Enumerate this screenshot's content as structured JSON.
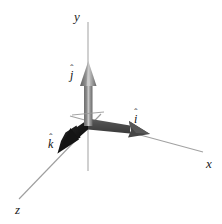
{
  "figure": {
    "background_color": "#ffffff",
    "width": 222,
    "height": 224
  },
  "axes": [
    {
      "name": "x-axis",
      "label": "x",
      "label_x": 206,
      "label_y": 157,
      "line_color": "#9a9a9a",
      "from": [
        70,
        116
      ],
      "to": [
        203,
        152
      ]
    },
    {
      "name": "y-axis",
      "label": "y",
      "label_x": 74,
      "label_y": 10,
      "line_color": "#b5b5b5",
      "from": [
        88,
        22
      ],
      "to": [
        88,
        171
      ]
    },
    {
      "name": "z-axis",
      "label": "z",
      "label_x": 15,
      "label_y": 203,
      "line_color": "#9a9a9a",
      "from": [
        101,
        114
      ],
      "to": [
        19,
        199
      ]
    }
  ],
  "vectors": [
    {
      "name": "i-hat",
      "letter": "i",
      "accent": "ˆ",
      "label_x": 134,
      "label_y": 113,
      "color": "#4a4a4a",
      "highlight_color": "#6e6e6e",
      "origin": [
        88,
        124
      ],
      "tip": [
        150,
        134
      ],
      "direction": "right-down"
    },
    {
      "name": "j-hat",
      "letter": "j",
      "accent": "ˆ",
      "label_x": 70,
      "label_y": 69,
      "color": "#7d7d7d",
      "highlight_color": "#bdbdbd",
      "origin": [
        88,
        124
      ],
      "tip": [
        88,
        61
      ],
      "direction": "up"
    },
    {
      "name": "k-hat",
      "letter": "k",
      "accent": "ˆ",
      "label_x": 48,
      "label_y": 138,
      "color": "#1c1c1c",
      "highlight_color": "#3a3a3a",
      "origin": [
        88,
        124
      ],
      "tip": [
        58,
        153
      ],
      "direction": "left-down"
    }
  ]
}
